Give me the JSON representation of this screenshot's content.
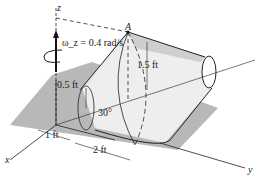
{
  "figure": {
    "axes": {
      "z": "z",
      "x": "x",
      "y": "y"
    },
    "point_label": "A",
    "angular_velocity": "ω_z = 0.4 rad/s",
    "dimensions": {
      "small_radius": "0.5 ft",
      "large_radius": "1.5 ft",
      "half_angle": "30°",
      "x_offset": "1 ft",
      "y_offset": "2 ft"
    },
    "colors": {
      "plane": "#b5b5b5",
      "shade": "#cfcfcf",
      "line": "#222222"
    }
  }
}
